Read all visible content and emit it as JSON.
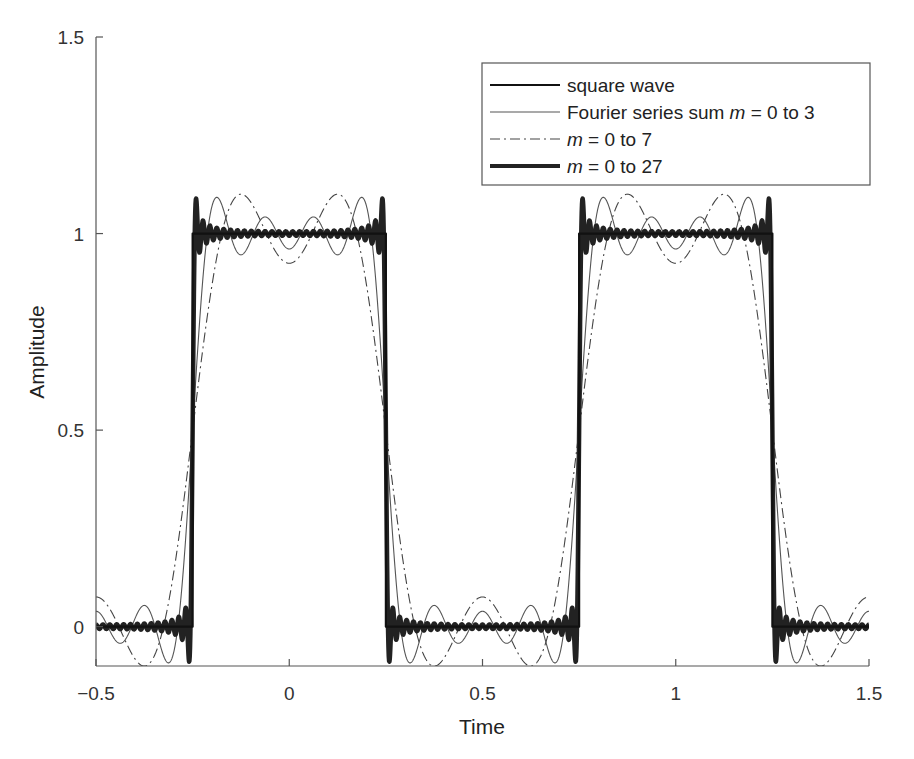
{
  "chart_data": {
    "type": "line",
    "title": "",
    "xlabel": "Time",
    "ylabel": "Amplitude",
    "xlim": [
      -0.5,
      1.5
    ],
    "ylim": [
      -0.1,
      1.5
    ],
    "xticks": [
      -0.5,
      0,
      0.5,
      1,
      1.5
    ],
    "xtick_labels": [
      "−0.5",
      "0",
      "0.5",
      "1",
      "1.5"
    ],
    "yticks": [
      0,
      0.5,
      1,
      1.5
    ],
    "ytick_labels": [
      "0",
      "0.5",
      "1",
      "1.5"
    ],
    "grid": false,
    "legend_position": "upper right",
    "series": [
      {
        "name": "square wave",
        "style": "solid",
        "width": 2.2,
        "color": "#111111",
        "kind": "square",
        "period": 1,
        "high_interval": [
          -0.25,
          0.25
        ],
        "low": 0,
        "high": 1
      },
      {
        "name": "Fourier series sum m = 0 to 3",
        "style": "solid",
        "width": 1.1,
        "color": "#555555",
        "kind": "fourier",
        "m_max": 3
      },
      {
        "name": "m = 0 to 7",
        "style": "dashdot",
        "width": 1.1,
        "color": "#444444",
        "kind": "fourier",
        "m_max": 1
      },
      {
        "name": "m = 0 to 27",
        "style": "solid",
        "width": 4.5,
        "color": "#222222",
        "kind": "fourier",
        "m_max": 27
      }
    ]
  },
  "legend": {
    "entries": [
      {
        "prefix": "square wave",
        "italic": "",
        "suffix": ""
      },
      {
        "prefix": "Fourier series sum ",
        "italic": "m",
        "suffix": " = 0 to 3"
      },
      {
        "prefix": "",
        "italic": "m",
        "suffix": " = 0 to 7"
      },
      {
        "prefix": "",
        "italic": "m",
        "suffix": " = 0 to 27"
      }
    ]
  }
}
